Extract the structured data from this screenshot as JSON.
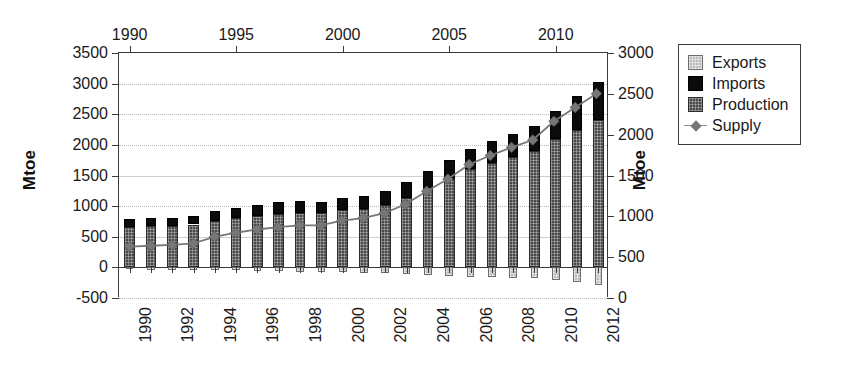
{
  "chart_data": {
    "type": "bar",
    "title": "",
    "xlabel": "",
    "ylabel": "Mtoe",
    "ylabel_right": "Mtoe",
    "ylim": [
      -500,
      3500
    ],
    "ylim_right": [
      0,
      3000
    ],
    "ytick_step": 500,
    "grid": true,
    "legend_position": "right-outside",
    "stacked": true,
    "bar_segments": [
      "Production",
      "Imports"
    ],
    "negative_segments": [
      "Exports"
    ],
    "line_series": [
      "Supply"
    ],
    "x": [
      1990,
      1991,
      1992,
      1993,
      1994,
      1995,
      1996,
      1997,
      1998,
      1999,
      2000,
      2001,
      2002,
      2003,
      2004,
      2005,
      2006,
      2007,
      2008,
      2009,
      2010,
      2011,
      2012
    ],
    "categories": [
      "1990",
      "1991",
      "1992",
      "1993",
      "1994",
      "1995",
      "1996",
      "1997",
      "1998",
      "1999",
      "2000",
      "2001",
      "2002",
      "2003",
      "2004",
      "2005",
      "2006",
      "2007",
      "2008",
      "2009",
      "2010",
      "2011",
      "2012"
    ],
    "xticklabels_bottom": [
      "1990",
      "",
      "1992",
      "",
      "1994",
      "",
      "1996",
      "",
      "1998",
      "",
      "2000",
      "",
      "2002",
      "",
      "2004",
      "",
      "2006",
      "",
      "2008",
      "",
      "2010",
      "",
      "2012"
    ],
    "xticklabels_top": [
      "1990",
      "1995",
      "2000",
      "2005",
      "2010"
    ],
    "xticks_top_values": [
      1990,
      1995,
      2000,
      2005,
      2010
    ],
    "yticklabels_left": [
      "3500",
      "3000",
      "2500",
      "2000",
      "1500",
      "1000",
      "500",
      "0",
      "-500"
    ],
    "ytickvalues_left": [
      3500,
      3000,
      2500,
      2000,
      1500,
      1000,
      500,
      0,
      -500
    ],
    "yticklabels_right": [
      "3000",
      "2500",
      "2000",
      "1500",
      "1000",
      "500",
      "0"
    ],
    "ytickvalues_right": [
      3000,
      2500,
      2000,
      1500,
      1000,
      500,
      0
    ],
    "series": [
      {
        "name": "Production",
        "type": "bar",
        "color": "#4a4a4a",
        "axis": "left",
        "values": [
          660,
          670,
          680,
          700,
          760,
          800,
          840,
          870,
          880,
          880,
          930,
          960,
          1020,
          1140,
          1300,
          1450,
          1600,
          1700,
          1800,
          1900,
          2100,
          2250,
          2400
        ]
      },
      {
        "name": "Imports",
        "type": "bar",
        "color": "#0b0b0b",
        "axis": "left",
        "values": [
          130,
          130,
          130,
          140,
          160,
          170,
          180,
          190,
          200,
          190,
          200,
          210,
          230,
          250,
          270,
          300,
          330,
          360,
          380,
          410,
          460,
          540,
          620
        ]
      },
      {
        "name": "Exports",
        "type": "bar",
        "color": "#bdbdbd",
        "axis": "left",
        "values": [
          -30,
          -35,
          -35,
          -40,
          -45,
          -50,
          -60,
          -65,
          -70,
          -70,
          -80,
          -85,
          -95,
          -105,
          -120,
          -135,
          -150,
          -160,
          -170,
          -180,
          -200,
          -240,
          -280
        ]
      },
      {
        "name": "Supply",
        "type": "line",
        "color": "#777777",
        "marker": "diamond",
        "axis": "right",
        "values": [
          620,
          630,
          640,
          660,
          740,
          790,
          830,
          860,
          880,
          880,
          940,
          970,
          1030,
          1140,
          1300,
          1450,
          1630,
          1740,
          1840,
          1930,
          2160,
          2330,
          2500
        ]
      }
    ]
  },
  "legend": {
    "items": [
      {
        "label": "Exports",
        "swatch": "exports-swatch"
      },
      {
        "label": "Imports",
        "swatch": "imports-swatch"
      },
      {
        "label": "Production",
        "swatch": "production-swatch"
      },
      {
        "label": "Supply",
        "swatch": "supply-line-swatch"
      }
    ]
  },
  "axes": {
    "left_title": "Mtoe",
    "right_title": "Mtoe"
  }
}
